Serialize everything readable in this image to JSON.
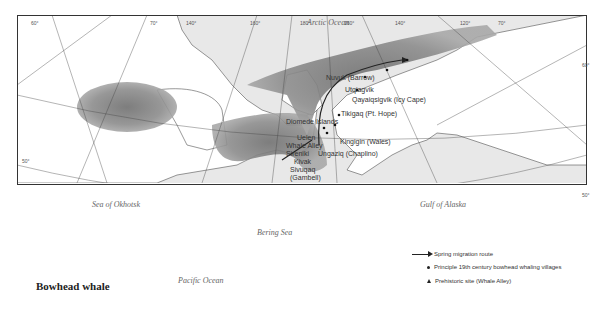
{
  "map": {
    "title": "Bowhead whale",
    "oceans": {
      "arctic": "Arctic Ocean",
      "okhotsk": "Sea of Okhotsk",
      "bering": "Bering Sea",
      "alaska": "Gulf of Alaska",
      "pacific": "Pacific Ocean"
    },
    "degrees": [
      "60°",
      "70°",
      "140°",
      "160°",
      "180°",
      "160°",
      "140°",
      "120°",
      "70°",
      "60°",
      "50°",
      "50°"
    ],
    "places": [
      {
        "id": "nuvuk",
        "label": "Nuvuk (Barrow)"
      },
      {
        "id": "utqiagvik",
        "label": "Utqiagvik"
      },
      {
        "id": "qayaiqsigvik",
        "label": "Qayaiqsigvik (Icy Cape)"
      },
      {
        "id": "tikigaq",
        "label": "Tikigaq (Pt. Hope)"
      },
      {
        "id": "diomede",
        "label": "Diomede Islands"
      },
      {
        "id": "uelen",
        "label": "Uelen"
      },
      {
        "id": "kingigin",
        "label": "Kingigin (Wales)"
      },
      {
        "id": "whale_alley",
        "label": "Whale Alley"
      },
      {
        "id": "sireniki",
        "label": "Sireniki"
      },
      {
        "id": "ungaziq",
        "label": "Ungaziq (Chaplino)"
      },
      {
        "id": "kivak",
        "label": "Kivak"
      },
      {
        "id": "sivuqaq",
        "label": "Sivuqaq"
      },
      {
        "id": "gambell",
        "label": "(Gambell)"
      },
      {
        "id": "qagal",
        "label": "Qagal"
      }
    ]
  },
  "legend": {
    "items": [
      {
        "symbol": "arrow",
        "label": "Spring migration route"
      },
      {
        "symbol": "dot",
        "label": "Principle 19th century bowhead whaling villages"
      },
      {
        "symbol": "triangle",
        "label": "Prehistoric site (Whale Alley)"
      }
    ]
  },
  "colors": {
    "sea": "#e6e6e6",
    "land": "#ffffff",
    "range": "#8a8a8a",
    "frame": "#333333"
  }
}
